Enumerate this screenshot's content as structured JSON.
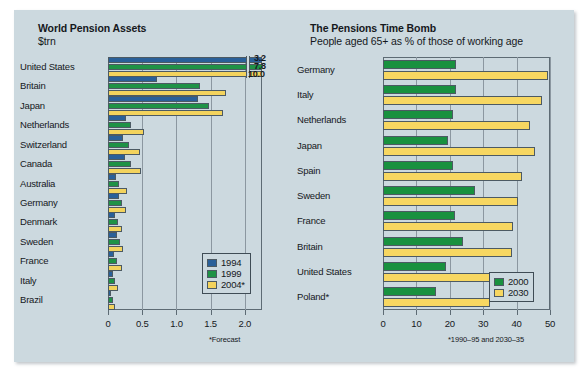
{
  "panel": {
    "background": "#ccd9df"
  },
  "colors": {
    "blue_1994": "#2a6099",
    "green_1999": "#1f9246",
    "yellow_2004": "#f3d35d",
    "green_2000": "#19913f",
    "yellow_2030": "#f7d761",
    "axis": "#5d6b74",
    "grid": "#8b97a0"
  },
  "left": {
    "title": "World Pension Assets",
    "subtitle": "$trn",
    "footnote": "*Forecast",
    "legend": [
      "1994",
      "1999",
      "2004*"
    ],
    "callouts": [
      "3.2",
      "7.8",
      "10.0"
    ]
  },
  "right": {
    "title": "The Pensions Time Bomb",
    "subtitle": "People aged 65+ as % of those of working age",
    "footnote": "*1990–95 and 2030–35",
    "legend": [
      "2000",
      "2030"
    ]
  },
  "chart_data": [
    {
      "type": "bar",
      "orientation": "horizontal",
      "title": "World Pension Assets",
      "subtitle": "$trn",
      "xlabel": "",
      "ylabel": "",
      "xlim": [
        0,
        2.25
      ],
      "xticks": [
        0,
        0.5,
        1.0,
        1.5,
        2.0
      ],
      "xticklabels": [
        "0",
        "0.5",
        "1.0",
        "1.5",
        "2.0"
      ],
      "grid": true,
      "legend_position": "bottom-right",
      "note": "United States bars are truncated at the axis edge with break marks; their true values are labelled 3.2, 7.8 and 10.0",
      "categories": [
        "United States",
        "Britain",
        "Japan",
        "Netherlands",
        "Switzerland",
        "Canada",
        "Australia",
        "Germany",
        "Denmark",
        "Sweden",
        "France",
        "Italy",
        "Brazil"
      ],
      "series": [
        {
          "name": "1994",
          "color": "#2a6099",
          "values": [
            3.2,
            0.72,
            1.32,
            0.27,
            0.22,
            0.25,
            0.12,
            0.16,
            0.1,
            0.13,
            0.09,
            0.07,
            0.05
          ]
        },
        {
          "name": "1999",
          "color": "#1f9246",
          "values": [
            7.8,
            1.35,
            1.48,
            0.33,
            0.3,
            0.33,
            0.16,
            0.2,
            0.14,
            0.17,
            0.13,
            0.1,
            0.07
          ]
        },
        {
          "name": "2004*",
          "color": "#f3d35d",
          "values": [
            10.0,
            1.72,
            1.68,
            0.53,
            0.47,
            0.48,
            0.28,
            0.26,
            0.2,
            0.22,
            0.2,
            0.14,
            0.1
          ]
        }
      ]
    },
    {
      "type": "bar",
      "orientation": "horizontal",
      "title": "The Pensions Time Bomb",
      "subtitle": "People aged 65+ as % of those of working age",
      "xlabel": "",
      "ylabel": "",
      "xlim": [
        0,
        50
      ],
      "xticks": [
        0,
        10,
        20,
        30,
        40,
        50
      ],
      "xticklabels": [
        "0",
        "10",
        "20",
        "30",
        "40",
        "50"
      ],
      "grid": true,
      "legend_position": "bottom-right",
      "categories": [
        "Germany",
        "Italy",
        "Netherlands",
        "Japan",
        "Spain",
        "Sweden",
        "France",
        "Britain",
        "United States",
        "Poland*"
      ],
      "series": [
        {
          "name": "2000",
          "color": "#19913f",
          "values": [
            22.0,
            22.0,
            21.0,
            19.5,
            21.0,
            27.5,
            21.5,
            24.0,
            19.0,
            16.0
          ]
        },
        {
          "name": "2030",
          "color": "#f7d761",
          "values": [
            49.5,
            47.5,
            44.0,
            45.5,
            41.5,
            40.5,
            39.0,
            38.5,
            36.5,
            32.0
          ]
        }
      ]
    }
  ]
}
